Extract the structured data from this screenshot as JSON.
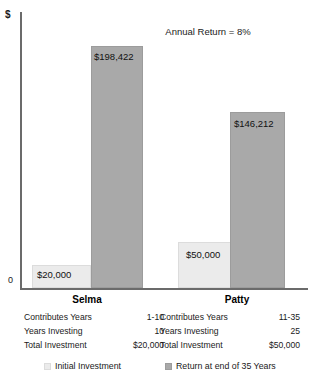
{
  "chart_data": {
    "type": "bar",
    "title": "Annual Return = 8%",
    "xlabel": "",
    "ylabel": "$",
    "y_zero_label": "0",
    "ylim": [
      0,
      238000
    ],
    "grid": false,
    "legend_position": "bottom",
    "categories": [
      "Selma",
      "Patty"
    ],
    "series": [
      {
        "name": "Initial Investment",
        "color": "#ebebeb",
        "values": [
          20000,
          50000
        ],
        "labels": [
          "$20,000",
          "$50,000"
        ]
      },
      {
        "name": "Return at end of 35 Years",
        "color": "#a9a9a9",
        "values": [
          198422,
          146212
        ],
        "labels": [
          "$198,422",
          "$146,212"
        ]
      }
    ]
  },
  "chart": {
    "axis_dollar": "$",
    "axis_zero": "0",
    "title": "Annual Return = 8%",
    "bars": [
      {
        "name": "selma-initial",
        "label": "$20,000",
        "left": 32,
        "width": 59,
        "top": 265,
        "height": 23,
        "tone": "light",
        "value_x": 37,
        "value_y": 270
      },
      {
        "name": "selma-return",
        "label": "$198,422",
        "left": 91,
        "width": 52,
        "top": 46,
        "height": 242,
        "tone": "dark",
        "value_x": 94,
        "value_y": 52
      },
      {
        "name": "patty-initial",
        "label": "$50,000",
        "left": 178,
        "width": 54,
        "top": 242,
        "height": 46,
        "tone": "light",
        "value_x": 186,
        "value_y": 250
      },
      {
        "name": "patty-return",
        "label": "$146,212",
        "left": 230,
        "width": 55,
        "top": 112,
        "height": 176,
        "tone": "dark",
        "value_x": 234,
        "value_y": 119
      }
    ],
    "category_labels": [
      {
        "name": "selma",
        "text": "Selma",
        "left": 57,
        "width": 60
      },
      {
        "name": "patty",
        "text": "Patty",
        "left": 207,
        "width": 60
      }
    ]
  },
  "tables": [
    {
      "person": "Selma",
      "rows": [
        {
          "label": "Contributes Years",
          "value": "1-10"
        },
        {
          "label": "Years Investing",
          "value": "10"
        },
        {
          "label": "Total Investment",
          "value": "$20,000"
        }
      ]
    },
    {
      "person": "Patty",
      "rows": [
        {
          "label": "Contributes Years",
          "value": "11-35"
        },
        {
          "label": "Years Investing",
          "value": "25"
        },
        {
          "label": "Total Investment",
          "value": "$50,000"
        }
      ]
    }
  ],
  "legend": {
    "items": [
      {
        "label": "Initial Investment",
        "tone": "light"
      },
      {
        "label": "Return at end of 35 Years",
        "tone": "dark"
      }
    ]
  }
}
